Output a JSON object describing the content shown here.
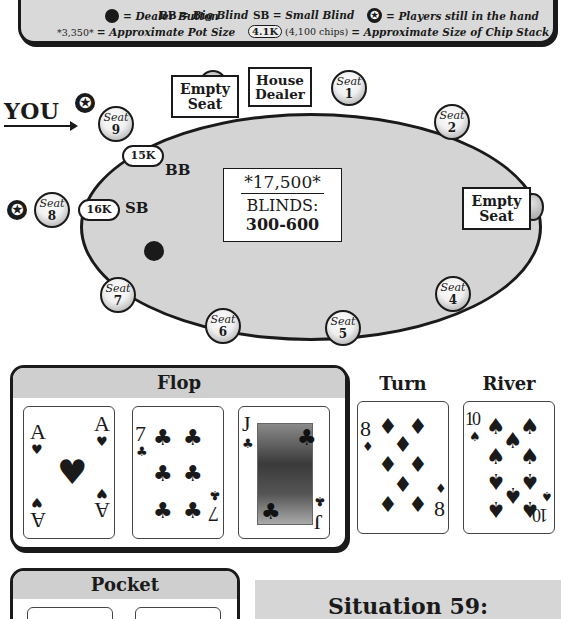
{
  "legend": {
    "dealer_button": "= Dealer Button",
    "bb": "BB",
    "bb_desc": "= Big Blind",
    "sb": "SB",
    "sb_desc": "= Small Blind",
    "star_desc": "= Players still in the hand",
    "pot_example": "*3,350*",
    "pot_desc": "= Approximate Pot Size",
    "chip_example": "4.1K",
    "chip_example_note": "(4,100 chips)",
    "chip_desc": "= Approximate Size of Chip Stack"
  },
  "table": {
    "you_label": "YOU",
    "pot": "*17,500*",
    "blinds_label": "BLINDS:",
    "blinds_value": "300-600",
    "house_dealer": [
      "House",
      "Dealer"
    ],
    "empty_seat_top": [
      "Empty",
      "Seat"
    ],
    "empty_seat_right": [
      "Empty",
      "Seat"
    ],
    "seat_word": "Seat",
    "seats": [
      {
        "num": "1"
      },
      {
        "num": "2"
      },
      {
        "num": "4"
      },
      {
        "num": "5"
      },
      {
        "num": "6"
      },
      {
        "num": "7"
      },
      {
        "num": "8"
      },
      {
        "num": "9"
      }
    ],
    "seat9_stack": "15K",
    "seat9_position": "BB",
    "seat8_stack": "16K",
    "seat8_position": "SB",
    "dealer_button_position": "Seat 7",
    "players_in_hand": [
      "Seat 9 (You)",
      "Seat 8"
    ]
  },
  "board": {
    "flop_label": "Flop",
    "turn_label": "Turn",
    "river_label": "River",
    "flop": [
      {
        "rank": "A",
        "suit": "♥",
        "suit_name": "hearts"
      },
      {
        "rank": "7",
        "suit": "♣",
        "suit_name": "clubs"
      },
      {
        "rank": "J",
        "suit": "♣",
        "suit_name": "clubs"
      }
    ],
    "turn": {
      "rank": "8",
      "suit": "♦",
      "suit_name": "diamonds"
    },
    "river": {
      "rank": "10",
      "suit": "♠",
      "suit_name": "spades"
    }
  },
  "pocket": {
    "label": "Pocket"
  },
  "situation": {
    "title": "Situation 59:"
  },
  "colors": {
    "ink": "#1a1a1a",
    "felt": "#d4d4d4",
    "panel_header": "#cfcfcf"
  }
}
